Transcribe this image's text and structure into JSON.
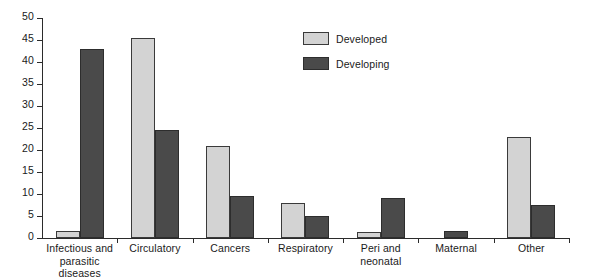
{
  "chart_data": {
    "type": "bar",
    "title": "",
    "xlabel": "",
    "ylabel": "",
    "ylim": [
      0,
      50
    ],
    "yticks": [
      0,
      5,
      10,
      15,
      20,
      25,
      30,
      35,
      40,
      45,
      50
    ],
    "grid": false,
    "legend_position": "top-center",
    "categories": [
      "Infectious and\nparasitic diseases",
      "Circulatory",
      "Cancers",
      "Respiratory",
      "Peri and\nneonatal",
      "Maternal",
      "Other"
    ],
    "series": [
      {
        "name": "Developed",
        "color": "#d3d3d3",
        "values": [
          1.5,
          45.5,
          21,
          8,
          1.3,
          0,
          23
        ]
      },
      {
        "name": "Developing",
        "color": "#4a4a4a",
        "values": [
          43,
          24.5,
          9.5,
          5,
          9,
          1.5,
          7.5
        ]
      }
    ]
  },
  "legend": {
    "items": [
      {
        "label": "Developed"
      },
      {
        "label": "Developing"
      }
    ]
  },
  "colors": {
    "developed": "#d3d3d3",
    "developing": "#4a4a4a",
    "axis": "#2b2b2b",
    "background": "#ffffff"
  }
}
